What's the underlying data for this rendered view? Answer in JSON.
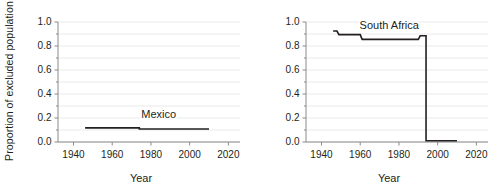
{
  "chart_data": [
    {
      "type": "line",
      "panel": "left",
      "title": "",
      "xlabel": "Year",
      "ylabel": "Proportion of excluded population",
      "xlim": [
        1932,
        2026
      ],
      "ylim": [
        0.0,
        1.0
      ],
      "xticks": [
        1940,
        1960,
        1980,
        2000,
        2020
      ],
      "xticklabels": [
        "1940",
        "1960",
        "1980",
        "2000",
        "2020"
      ],
      "yticks": [
        0.0,
        0.2,
        0.4,
        0.6,
        0.8,
        1.0
      ],
      "yticklabels": [
        "0.0",
        "0.2",
        "0.4",
        "0.6",
        "0.8",
        "1.0"
      ],
      "yminorticks": [
        0.1,
        0.3,
        0.5,
        0.7,
        0.9
      ],
      "grid": "horizontal",
      "series": [
        {
          "name": "Mexico",
          "label": "Mexico",
          "label_x": 1984,
          "label_y": 0.2,
          "color": "#231f20",
          "x": [
            1946,
            1974,
            1974,
            2010
          ],
          "values": [
            0.118,
            0.118,
            0.108,
            0.108
          ]
        }
      ]
    },
    {
      "type": "line",
      "panel": "right",
      "title": "",
      "xlabel": "Year",
      "ylabel": "",
      "xlim": [
        1932,
        2026
      ],
      "ylim": [
        0.0,
        1.0
      ],
      "xticks": [
        1940,
        1960,
        1980,
        2000,
        2020
      ],
      "xticklabels": [
        "1940",
        "1960",
        "1980",
        "2000",
        "2020"
      ],
      "yticks": [
        0.0,
        0.2,
        0.4,
        0.6,
        0.8,
        1.0
      ],
      "yticklabels": [
        "0.0",
        "0.2",
        "0.4",
        "0.6",
        "0.8",
        "1.0"
      ],
      "yminorticks": [
        0.1,
        0.3,
        0.5,
        0.7,
        0.9
      ],
      "grid": "horizontal",
      "series": [
        {
          "name": "South Africa",
          "label": "South Africa",
          "label_x": 1975,
          "label_y": 0.945,
          "color": "#231f20",
          "x": [
            1946,
            1948,
            1949,
            1960,
            1961,
            1990,
            1991,
            1994,
            1994,
            2010
          ],
          "values": [
            0.925,
            0.925,
            0.895,
            0.895,
            0.855,
            0.855,
            0.885,
            0.885,
            0.01,
            0.01
          ]
        }
      ]
    }
  ],
  "axes": {
    "y_axis_title": "Proportion of excluded population",
    "x_axis_title_left": "Year",
    "x_axis_title_right": "Year"
  }
}
